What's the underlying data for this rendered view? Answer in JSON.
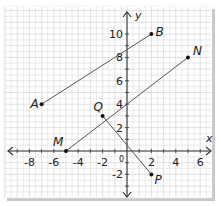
{
  "figure": {
    "axes": {
      "x_label": "x",
      "y_label": "y",
      "origin_label": "0",
      "x_ticks": [
        -8,
        -6,
        -4,
        -2,
        2,
        4,
        6
      ],
      "y_ticks": [
        -2,
        2,
        4,
        6,
        8,
        10
      ],
      "x_range": [
        -9.5,
        7
      ],
      "y_range": [
        -4,
        11
      ]
    },
    "points": [
      {
        "label": "A",
        "x": -7,
        "y": 4
      },
      {
        "label": "B",
        "x": 2,
        "y": 10
      },
      {
        "label": "M",
        "x": -5,
        "y": 0
      },
      {
        "label": "N",
        "x": 5,
        "y": 8
      },
      {
        "label": "Q",
        "x": -2,
        "y": 3
      },
      {
        "label": "P",
        "x": 2,
        "y": -2
      }
    ],
    "segments": [
      {
        "from": "A",
        "to": "B"
      },
      {
        "from": "M",
        "to": "N"
      },
      {
        "from": "Q",
        "to": "P"
      }
    ],
    "colors": {
      "grid": "#d9d9d9",
      "axis": "#333333",
      "segment": "#555555",
      "point": "#111111",
      "shadow": "#bdbdbd"
    }
  }
}
